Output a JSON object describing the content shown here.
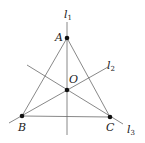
{
  "diagram": {
    "type": "geometry",
    "points": [
      {
        "id": "A",
        "label": "A",
        "x": 67,
        "y": 38
      },
      {
        "id": "B",
        "label": "B",
        "x": 22,
        "y": 116
      },
      {
        "id": "C",
        "label": "C",
        "x": 110,
        "y": 117
      },
      {
        "id": "O",
        "label": "O",
        "x": 67,
        "y": 90
      }
    ],
    "lines": [
      {
        "id": "l1",
        "label": "l",
        "subscript": "1",
        "through": [
          "A",
          "O"
        ]
      },
      {
        "id": "l2",
        "label": "l",
        "subscript": "2",
        "through": [
          "B",
          "O"
        ]
      },
      {
        "id": "l3",
        "label": "l",
        "subscript": "3",
        "through": [
          "C",
          "O"
        ]
      }
    ],
    "segments": [
      {
        "from": "A",
        "to": "B"
      },
      {
        "from": "B",
        "to": "C"
      },
      {
        "from": "C",
        "to": "A"
      }
    ],
    "colors": {
      "line": "#6a6a6a",
      "point": "#111111",
      "text": "#222222"
    }
  }
}
